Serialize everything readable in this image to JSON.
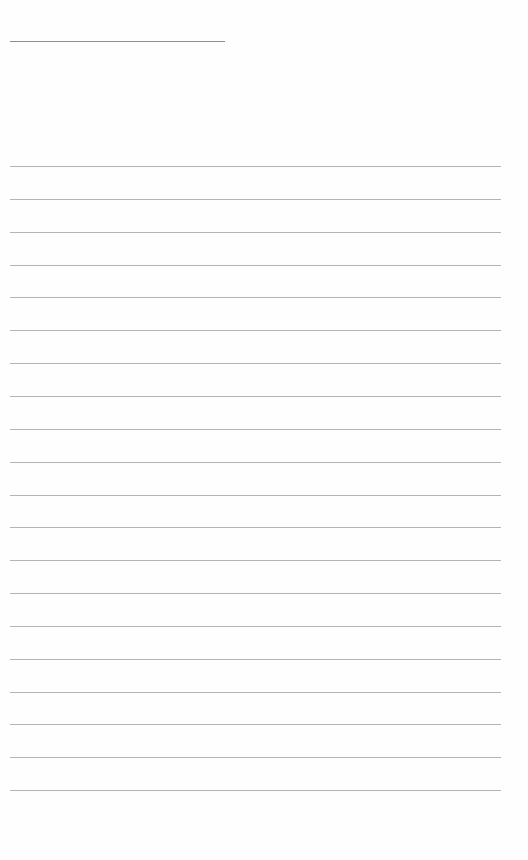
{
  "page": {
    "type": "blank-ruled-sheet",
    "header_rule": {
      "x": 10,
      "y": 41,
      "width": 215
    },
    "ruled_lines": {
      "x_start": 10,
      "x_end": 501,
      "first_y": 166,
      "spacing": 32.85,
      "count": 20
    },
    "colors": {
      "background": "#fefefe",
      "line": "#b4b4b4",
      "header_line": "#8e8e8e"
    }
  }
}
